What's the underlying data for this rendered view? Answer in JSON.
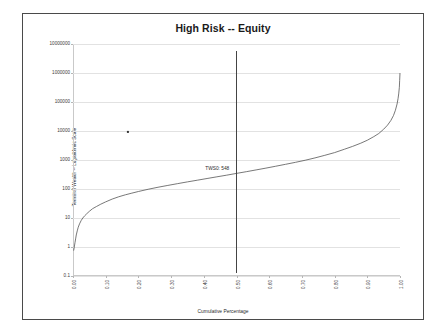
{
  "chart_data": {
    "type": "line",
    "title": "High Risk -- Equity",
    "xlabel": "Cumulative Percentage",
    "ylabel": "Terminal Wealth -- Logarithmic Scale",
    "yscale": "log",
    "ylim": [
      0.1,
      10000000
    ],
    "xlim": [
      0.0,
      1.0
    ],
    "grid": true,
    "legend": false,
    "ytick_labels": [
      "10000000",
      "1000000",
      "100000",
      "10000",
      "1000",
      "100",
      "10",
      "1",
      "0.1"
    ],
    "ytick_values": [
      10000000,
      1000000,
      100000,
      10000,
      1000,
      100,
      10,
      1,
      0.1
    ],
    "xtick_labels": [
      "0.00",
      "0.10",
      "0.20",
      "0.30",
      "0.40",
      "0.50",
      "0.60",
      "0.70",
      "0.80",
      "0.90",
      "1.00"
    ],
    "xtick_values": [
      0.0,
      0.1,
      0.2,
      0.3,
      0.4,
      0.5,
      0.6,
      0.7,
      0.8,
      0.9,
      1.0
    ],
    "series": [
      {
        "name": "Terminal Wealth",
        "x": [
          0.002,
          0.004,
          0.006,
          0.008,
          0.01,
          0.013,
          0.016,
          0.02,
          0.025,
          0.03,
          0.036,
          0.042,
          0.05,
          0.06,
          0.072,
          0.085,
          0.1,
          0.12,
          0.14,
          0.16,
          0.18,
          0.2,
          0.23,
          0.26,
          0.29,
          0.32,
          0.35,
          0.38,
          0.41,
          0.44,
          0.47,
          0.5,
          0.53,
          0.56,
          0.59,
          0.62,
          0.65,
          0.68,
          0.71,
          0.74,
          0.77,
          0.8,
          0.83,
          0.855,
          0.88,
          0.9,
          0.92,
          0.935,
          0.95,
          0.962,
          0.972,
          0.98,
          0.986,
          0.991,
          0.994,
          0.996,
          0.998,
          0.999,
          1.0
        ],
        "y": [
          0.75,
          1.0,
          1.4,
          1.9,
          2.6,
          3.6,
          4.8,
          6.3,
          8.2,
          10.0,
          12.0,
          14.0,
          17.0,
          21.0,
          25.0,
          30.0,
          36.0,
          45.0,
          54.0,
          63.0,
          72.0,
          82.0,
          98.0,
          115.0,
          133.0,
          153.0,
          176.0,
          201.0,
          230.0,
          263.0,
          300.0,
          345.0,
          395.0,
          455.0,
          525.0,
          610.0,
          710.0,
          830.0,
          980.0,
          1180.0,
          1450.0,
          1800.0,
          2350.0,
          2950.0,
          3800.0,
          4800.0,
          6400.0,
          8200.0,
          11500.0,
          16000.0,
          23000.0,
          34000.0,
          52000.0,
          85000.0,
          130000.0,
          190000.0,
          320000.0,
          560000.0,
          1000000.0
        ]
      }
    ],
    "annotations": [
      {
        "name": "median-marker-line",
        "type": "vline",
        "x": 0.5,
        "label": "TWS0: 548",
        "label_x": 0.49,
        "label_y": 548
      },
      {
        "name": "outlier-point",
        "type": "point",
        "x": 0.168,
        "y": 9500
      }
    ]
  }
}
